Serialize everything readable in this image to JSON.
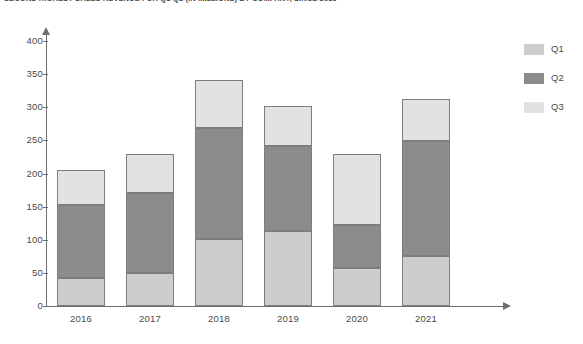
{
  "chart_data": {
    "type": "bar",
    "title": "SECOND HIGHEST SALES REVENUE FOR Q1-Q3 (IN MILLIONS) BY COMPANY, SINCE 2016",
    "xlabel": "",
    "ylabel": "",
    "categories": [
      "2016",
      "2017",
      "2018",
      "2019",
      "2020",
      "2021"
    ],
    "series": [
      {
        "name": "Q1",
        "values": [
          43,
          50,
          101,
          113,
          58,
          76
        ],
        "color": "#cdcdcd"
      },
      {
        "name": "Q2",
        "values": [
          109,
          120,
          167,
          129,
          64,
          173
        ],
        "color": "#8c8c8c"
      },
      {
        "name": "Q3",
        "values": [
          54,
          60,
          73,
          60,
          108,
          63
        ],
        "color": "#e2e2e2"
      }
    ],
    "totals": [
      206,
      230,
      341,
      302,
      230,
      312
    ],
    "stacked": true,
    "ylim": [
      0,
      400
    ],
    "yticks": [
      0,
      50,
      100,
      150,
      200,
      250,
      300,
      350,
      400
    ],
    "grid": false,
    "legend_position": "right",
    "axis_color": "#6f6f6f",
    "bar_border_color": "#7d7d7d"
  },
  "legend": {
    "items": [
      {
        "label": "Q1"
      },
      {
        "label": "Q2"
      },
      {
        "label": "Q3"
      }
    ]
  }
}
